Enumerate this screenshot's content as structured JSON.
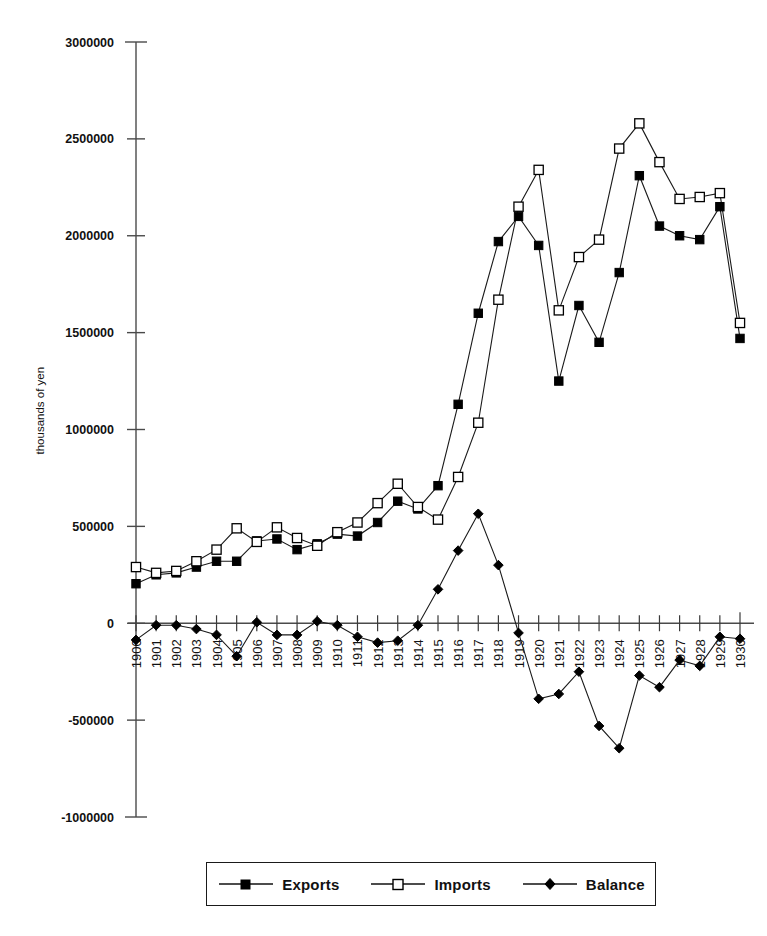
{
  "chart_data": {
    "type": "line",
    "title": "",
    "xlabel": "",
    "ylabel": "thousands of yen",
    "ylim": [
      -1000000,
      3000000
    ],
    "ytick_values": [
      3000000,
      2500000,
      2000000,
      1500000,
      1000000,
      500000,
      0,
      -500000,
      -1000000
    ],
    "ytick_labels": [
      "3000000",
      "2500000",
      "2000000",
      "1500000",
      "1000000",
      "500000",
      "0",
      "-500000",
      "-1000000"
    ],
    "grid": false,
    "legend_position": "bottom",
    "x": [
      1900,
      1901,
      1902,
      1903,
      1904,
      1905,
      1906,
      1907,
      1908,
      1909,
      1910,
      1911,
      1912,
      1913,
      1914,
      1915,
      1916,
      1917,
      1918,
      1919,
      1920,
      1921,
      1922,
      1923,
      1924,
      1925,
      1926,
      1927,
      1928,
      1929,
      1930
    ],
    "xtick_labels": [
      "1900",
      "1901",
      "1902",
      "1903",
      "1904",
      "1905",
      "1906",
      "1907",
      "1908",
      "1909",
      "1910",
      "1911",
      "1912",
      "1913",
      "1914",
      "1915",
      "1916",
      "1917",
      "1918",
      "1919",
      "1920",
      "1921",
      "1922",
      "1923",
      "1924",
      "1925",
      "1926",
      "1927",
      "1928",
      "1929",
      "1930"
    ],
    "series": [
      {
        "name": "Exports",
        "marker": "filled-square",
        "values": [
          204000,
          250000,
          260000,
          290000,
          320000,
          320000,
          425000,
          435000,
          380000,
          410000,
          460000,
          450000,
          520000,
          630000,
          590000,
          710000,
          1130000,
          1600000,
          1970000,
          2100000,
          1950000,
          1250000,
          1640000,
          1450000,
          1810000,
          2310000,
          2050000,
          2000000,
          1980000,
          2150000,
          1470000
        ]
      },
      {
        "name": "Imports",
        "marker": "open-square",
        "values": [
          290000,
          260000,
          270000,
          320000,
          380000,
          490000,
          420000,
          495000,
          440000,
          400000,
          470000,
          520000,
          620000,
          720000,
          600000,
          535000,
          755000,
          1035000,
          1670000,
          2150000,
          2340000,
          1615000,
          1890000,
          1980000,
          2450000,
          2580000,
          2380000,
          2190000,
          2200000,
          2220000,
          1550000
        ]
      },
      {
        "name": "Balance",
        "marker": "filled-diamond",
        "values": [
          -86000,
          -10000,
          -10000,
          -30000,
          -60000,
          -170000,
          5000,
          -60000,
          -60000,
          10000,
          -10000,
          -70000,
          -100000,
          -90000,
          -10000,
          175000,
          375000,
          565000,
          300000,
          -50000,
          -390000,
          -365000,
          -250000,
          -530000,
          -645000,
          -270000,
          -330000,
          -190000,
          -220000,
          -70000,
          -80000
        ]
      }
    ]
  },
  "legend": {
    "items": [
      {
        "label": "Exports",
        "marker": "filled-square"
      },
      {
        "label": "Imports",
        "marker": "open-square"
      },
      {
        "label": "Balance",
        "marker": "filled-diamond"
      }
    ]
  },
  "axis": {
    "ylabel": "thousands of yen"
  }
}
